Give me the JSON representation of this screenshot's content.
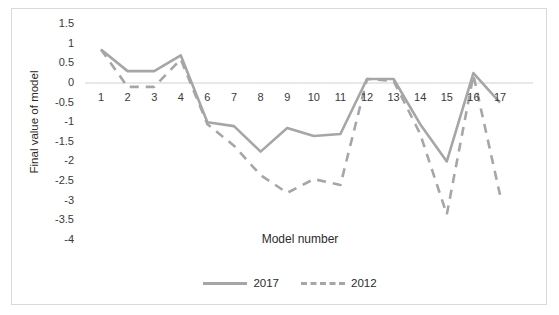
{
  "chart_data": {
    "type": "line",
    "title": "",
    "xlabel": "Model number",
    "ylabel": "Final value of model",
    "categories": [
      "1",
      "2",
      "3",
      "4",
      "6",
      "7",
      "8",
      "9",
      "10",
      "11",
      "12",
      "13",
      "14",
      "15",
      "16",
      "17"
    ],
    "x_tick_labels": [
      "1",
      "2",
      "3",
      "4",
      "6",
      "7",
      "8",
      "9",
      "10",
      "11",
      "12",
      "13",
      "14",
      "15",
      "16",
      "17"
    ],
    "y_tick_labels": [
      "1.5",
      "1",
      "0.5",
      "0",
      "-0.5",
      "-1",
      "-1.5",
      "-2",
      "-2.5",
      "-3",
      "-3.5",
      "-4"
    ],
    "y_ticks": [
      1.5,
      1,
      0.5,
      0,
      -0.5,
      -1,
      -1.5,
      -2,
      -2.5,
      -3,
      -3.5,
      -4
    ],
    "ylim": [
      -4,
      1.5
    ],
    "grid": false,
    "zero_line": true,
    "legend_position": "bottom",
    "series": [
      {
        "name": "2017",
        "style": "solid",
        "color": "#a6a6a6",
        "values": [
          0.85,
          0.3,
          0.3,
          0.7,
          -1.0,
          -1.1,
          -1.75,
          -1.15,
          -1.35,
          -1.3,
          0.1,
          0.1,
          -1.05,
          -2.0,
          0.25,
          -0.5
        ]
      },
      {
        "name": "2012",
        "style": "dashed",
        "color": "#a6a6a6",
        "values": [
          0.85,
          -0.1,
          -0.1,
          0.6,
          -1.05,
          -1.6,
          -2.35,
          -2.8,
          -2.45,
          -2.6,
          0.1,
          0.05,
          -1.3,
          -3.35,
          0.2,
          -2.85
        ]
      }
    ]
  },
  "legend": {
    "entries": [
      {
        "label": "2017"
      },
      {
        "label": "2012"
      }
    ]
  },
  "colors": {
    "line": "#a6a6a6",
    "zero_line": "#e0e0e0",
    "border": "#d9d9d9",
    "text": "#2b2b2b"
  }
}
